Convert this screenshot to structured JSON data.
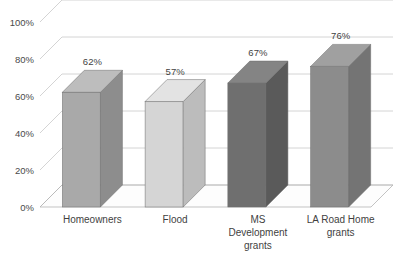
{
  "chart_data": {
    "type": "bar",
    "title": "",
    "subtitle": "",
    "xlabel": "",
    "ylabel": "",
    "categories": [
      "Homeowners",
      "Flood",
      "MS Development grants",
      "LA Road Home grants"
    ],
    "category_lines": [
      [
        "Homeowners"
      ],
      [
        "Flood"
      ],
      [
        "MS",
        "Development",
        "grants"
      ],
      [
        "LA Road Home",
        "grants"
      ]
    ],
    "values": [
      62,
      57,
      67,
      76
    ],
    "value_labels": [
      "62%",
      "57%",
      "67%",
      "76%"
    ],
    "ylim": [
      0,
      100
    ],
    "ytick_values": [
      0,
      20,
      40,
      60,
      80,
      100
    ],
    "ytick_labels": [
      "0%",
      "20%",
      "40%",
      "60%",
      "80%",
      "100%"
    ],
    "grid": true,
    "grid_axis": "y",
    "legend": false,
    "legend_position": "none",
    "style": "3d-column",
    "bar_colors": [
      "#a9a9a9",
      "#d5d5d5",
      "#6f6f6f",
      "#8c8c8c"
    ],
    "bar_top_colors": [
      "#bdbdbd",
      "#e3e3e3",
      "#848484",
      "#a0a0a0"
    ],
    "bar_side_colors": [
      "#8d8d8d",
      "#bcbcbc",
      "#5a5a5a",
      "#747474"
    ]
  },
  "colors": {
    "background": "#ffffff",
    "gridline": "#c9c9c9",
    "floorline": "#b4b4b4",
    "text": "#3f3f3f",
    "axis_text": "#4a4a4a"
  }
}
